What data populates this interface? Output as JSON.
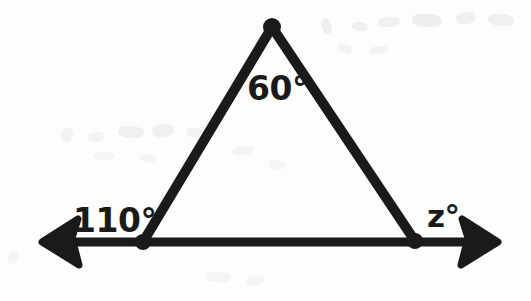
{
  "figure": {
    "kind": "geometry-diagram",
    "ink_color": "#1a1a1a",
    "background_color": "#fdfdfc",
    "canvas": {
      "width": 531,
      "height": 301
    }
  },
  "labels": {
    "apex_angle": "60°",
    "left_exterior_angle": "110°",
    "right_exterior_angle": "z°"
  },
  "geometry": {
    "vertices": {
      "apex": {
        "name": "apex-vertex",
        "x": 272,
        "y": 27
      },
      "base_left": {
        "name": "base-left-vertex",
        "x": 143,
        "y": 242
      },
      "base_right": {
        "name": "base-right-vertex",
        "x": 415,
        "y": 241
      }
    },
    "baseline": {
      "name": "extended-base-line",
      "x_start": 42,
      "x_end": 498,
      "y": 242,
      "stroke_width": 9,
      "arrowhead_left": true,
      "arrowhead_right": true
    },
    "edges": [
      {
        "name": "left-leg",
        "from": "base_left",
        "to": "apex",
        "stroke_width": 10
      },
      {
        "name": "right-leg",
        "from": "apex",
        "to": "base_right",
        "stroke_width": 10
      },
      {
        "name": "base-segment",
        "from": "base_left",
        "to": "base_right",
        "stroke_width": 9
      }
    ],
    "vertex_dot_radius": 8
  },
  "smudges": [
    {
      "x": 322,
      "y": 18,
      "w": 9,
      "h": 16,
      "rot": -18,
      "opacity": 0.055
    },
    {
      "x": 352,
      "y": 22,
      "w": 16,
      "h": 9,
      "rot": 8,
      "opacity": 0.05
    },
    {
      "x": 378,
      "y": 17,
      "w": 22,
      "h": 10,
      "rot": -6,
      "opacity": 0.05
    },
    {
      "x": 412,
      "y": 14,
      "w": 30,
      "h": 13,
      "rot": 4,
      "opacity": 0.06
    },
    {
      "x": 456,
      "y": 12,
      "w": 20,
      "h": 12,
      "rot": -10,
      "opacity": 0.05
    },
    {
      "x": 488,
      "y": 14,
      "w": 26,
      "h": 12,
      "rot": 6,
      "opacity": 0.05
    },
    {
      "x": 338,
      "y": 44,
      "w": 14,
      "h": 9,
      "rot": 12,
      "opacity": 0.04
    },
    {
      "x": 370,
      "y": 46,
      "w": 18,
      "h": 8,
      "rot": -4,
      "opacity": 0.04
    },
    {
      "x": 61,
      "y": 128,
      "w": 12,
      "h": 14,
      "rot": 20,
      "opacity": 0.045
    },
    {
      "x": 88,
      "y": 132,
      "w": 16,
      "h": 10,
      "rot": -8,
      "opacity": 0.04
    },
    {
      "x": 118,
      "y": 126,
      "w": 26,
      "h": 12,
      "rot": 5,
      "opacity": 0.05
    },
    {
      "x": 152,
      "y": 124,
      "w": 22,
      "h": 13,
      "rot": -5,
      "opacity": 0.05
    },
    {
      "x": 186,
      "y": 128,
      "w": 18,
      "h": 10,
      "rot": 10,
      "opacity": 0.04
    },
    {
      "x": 94,
      "y": 152,
      "w": 20,
      "h": 8,
      "rot": -3,
      "opacity": 0.035
    },
    {
      "x": 140,
      "y": 154,
      "w": 16,
      "h": 8,
      "rot": 7,
      "opacity": 0.035
    },
    {
      "x": 232,
      "y": 146,
      "w": 22,
      "h": 9,
      "rot": -6,
      "opacity": 0.035
    },
    {
      "x": 268,
      "y": 160,
      "w": 18,
      "h": 9,
      "rot": 9,
      "opacity": 0.03
    },
    {
      "x": 206,
      "y": 272,
      "w": 24,
      "h": 10,
      "rot": 4,
      "opacity": 0.035
    },
    {
      "x": 246,
      "y": 276,
      "w": 18,
      "h": 9,
      "rot": -7,
      "opacity": 0.03
    },
    {
      "x": 8,
      "y": 252,
      "w": 10,
      "h": 12,
      "rot": 15,
      "opacity": 0.04
    }
  ]
}
